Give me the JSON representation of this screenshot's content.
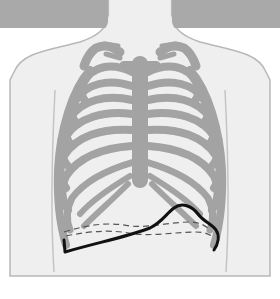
{
  "diagram": {
    "colors": {
      "background_band": "#a9a9a9",
      "torso_fill": "#efefef",
      "torso_outline": "#b8b8b8",
      "bone": "#a3a3a3",
      "diaphragm_line": "#111111",
      "dashed_line": "#555555",
      "page": "#ffffff"
    },
    "labels": []
  }
}
